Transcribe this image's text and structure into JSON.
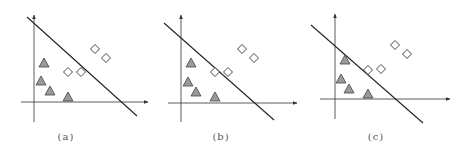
{
  "colors": {
    "axis": "#333333",
    "boundary": "#222222",
    "triangle_fill": "#9a9a9a",
    "triangle_stroke": "#444444",
    "diamond_fill": "#ffffff",
    "diamond_stroke": "#333333",
    "caption": "#555555"
  },
  "panels": [
    {
      "caption": "(a)",
      "caption_x": 66,
      "axes": {
        "origin_x": 34,
        "origin_y": 102,
        "y_top": 15,
        "y_bottom": 122,
        "x_left": 21,
        "x_right": 148
      },
      "boundary": {
        "x1": 27,
        "y1": 17,
        "x2": 137,
        "y2": 116
      },
      "triangles": [
        [
          44,
          63
        ],
        [
          41,
          81
        ],
        [
          50,
          91
        ],
        [
          68,
          97
        ]
      ],
      "diamonds": [
        [
          68,
          72
        ],
        [
          81,
          72
        ],
        [
          95,
          49
        ],
        [
          106,
          58
        ]
      ]
    },
    {
      "caption": "(b)",
      "caption_x": 221,
      "axes": {
        "origin_x": 181,
        "origin_y": 103,
        "y_top": 15,
        "y_bottom": 122,
        "x_left": 168,
        "x_right": 297
      },
      "boundary": {
        "x1": 164,
        "y1": 23,
        "x2": 274,
        "y2": 120
      },
      "triangles": [
        [
          191,
          63
        ],
        [
          188,
          82
        ],
        [
          196,
          92
        ],
        [
          215,
          97
        ]
      ],
      "diamonds": [
        [
          215,
          72
        ],
        [
          228,
          72
        ],
        [
          242,
          49
        ],
        [
          254,
          58
        ]
      ]
    },
    {
      "caption": "(c)",
      "caption_x": 376,
      "axes": {
        "origin_x": 335,
        "origin_y": 99,
        "y_top": 14,
        "y_bottom": 119,
        "x_left": 320,
        "x_right": 450
      },
      "boundary": {
        "x1": 311,
        "y1": 25,
        "x2": 423,
        "y2": 123
      },
      "triangles": [
        [
          345,
          60
        ],
        [
          341,
          79
        ],
        [
          349,
          89
        ],
        [
          368,
          94
        ]
      ],
      "diamonds": [
        [
          368,
          70
        ],
        [
          381,
          69
        ],
        [
          395,
          45
        ],
        [
          407,
          54
        ]
      ]
    }
  ]
}
